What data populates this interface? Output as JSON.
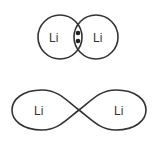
{
  "diagram": {
    "top": {
      "description": "Overlapping circles with shared electron pair",
      "atom_left": "Li",
      "atom_right": "Li",
      "shared_electrons": 2
    },
    "bottom": {
      "description": "Sigma bond orbital lobes (figure-eight)",
      "atom_left": "Li",
      "atom_right": "Li"
    },
    "colors": {
      "stroke": "#333333",
      "background": "#ffffff"
    }
  }
}
